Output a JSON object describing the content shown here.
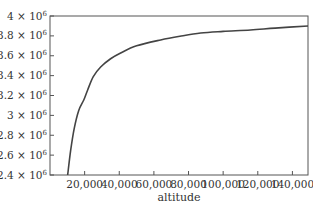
{
  "chart_data": {
    "type": "line",
    "title": "",
    "xlabel": "altitude",
    "ylabel": "",
    "xlim": [
      0,
      149000
    ],
    "ylim": [
      2400000,
      4000000
    ],
    "grid": false,
    "legend": null,
    "x_ticks": [
      20000,
      40000,
      60000,
      80000,
      100000,
      120000,
      140000
    ],
    "x_tick_labels": [
      "20,000",
      "40,000",
      "60,000",
      "80,000",
      "100,000",
      "120,000",
      "140,000"
    ],
    "y_ticks": [
      2400000,
      2600000,
      2800000,
      3000000,
      3200000,
      3400000,
      3600000,
      3800000,
      4000000
    ],
    "y_tick_labels": [
      {
        "mantissa": "2.4",
        "base": "10",
        "exp": "6"
      },
      {
        "mantissa": "2.6",
        "base": "10",
        "exp": "6"
      },
      {
        "mantissa": "2.8",
        "base": "10",
        "exp": "6"
      },
      {
        "mantissa": "3",
        "base": "10",
        "exp": "6"
      },
      {
        "mantissa": "3.2",
        "base": "10",
        "exp": "6"
      },
      {
        "mantissa": "3.4",
        "base": "10",
        "exp": "6"
      },
      {
        "mantissa": "3.6",
        "base": "10",
        "exp": "6"
      },
      {
        "mantissa": "3.8",
        "base": "10",
        "exp": "6"
      },
      {
        "mantissa": "4",
        "base": "10",
        "exp": "6"
      }
    ],
    "series": [
      {
        "name": "curve",
        "color": "#444444",
        "x": [
          10200,
          11950,
          14000,
          16600,
          19500,
          21750,
          25000,
          29250,
          35000,
          40800,
          50000,
          63900,
          75000,
          87000,
          100000,
          115800,
          130000,
          149000
        ],
        "y": [
          2400000,
          2650000,
          2870000,
          3050000,
          3155000,
          3256000,
          3390000,
          3487000,
          3570000,
          3628000,
          3700000,
          3759000,
          3796000,
          3829000,
          3845000,
          3859000,
          3878000,
          3900000
        ]
      }
    ]
  },
  "colors": {
    "frame": "#555555",
    "curve": "#444444",
    "text": "#333333"
  }
}
